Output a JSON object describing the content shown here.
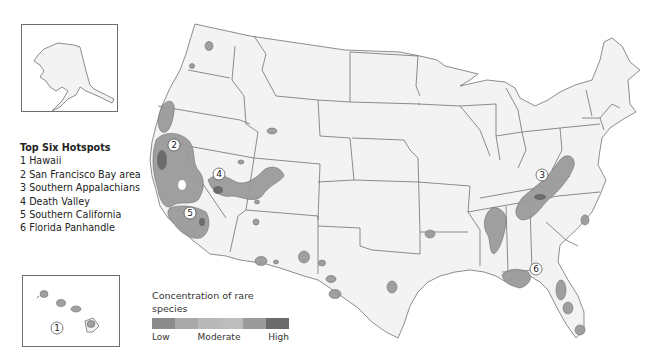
{
  "hotspots_legend": {
    "title": "Top Six Hotspots",
    "items": [
      "1 Hawaii",
      "2 San Francisco Bay area",
      "3 Southern Appalachians",
      "4 Death Valley",
      "5 Southern California",
      "6 Florida Panhandle"
    ]
  },
  "concentration_legend": {
    "title": "Concentration of rare species",
    "low_label": "Low",
    "moderate_label": "Moderate",
    "high_label": "High",
    "swatch_colors": [
      "#8c8c8c",
      "#a9a9a9",
      "#b9b9b9",
      "#bdbdbd",
      "#9b9b9b",
      "#6b6b6b"
    ]
  },
  "map_labels": {
    "hawaii": "1",
    "sf_bay": "2",
    "appalachians": "3",
    "death_valley": "4",
    "southern_california": "5",
    "florida_panhandle": "6"
  },
  "colors": {
    "state_fill": "#f3f3f3",
    "border": "#5e5e5e",
    "hotspot_low": "#9b9b9b",
    "hotspot_high": "#6b6b6b"
  }
}
